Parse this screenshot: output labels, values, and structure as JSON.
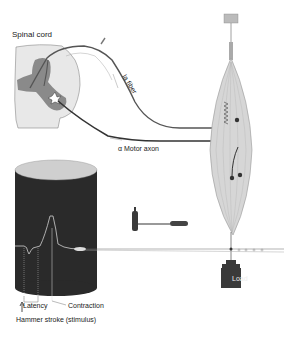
{
  "diagram": {
    "labels": {
      "spinal_cord": "Spinal cord",
      "ia_fiber": "Ia fiber",
      "motor_axon": "α Motor axon",
      "latency": "Latency",
      "contraction": "Contraction",
      "hammer_stroke": "Hammer stroke (stimulus)",
      "load": "Load"
    },
    "components": [
      {
        "id": "spinal-cord",
        "description": "cross-section of spinal cord with gray matter butterfly and motor neuron"
      },
      {
        "id": "ia-fiber",
        "description": "afferent fiber from muscle spindle to spinal cord"
      },
      {
        "id": "alpha-motor-axon",
        "description": "efferent axon from spinal cord to muscle"
      },
      {
        "id": "muscle",
        "description": "spindle-shaped muscle with muscle spindle and motor endplates"
      },
      {
        "id": "kymograph-drum",
        "description": "dark recording drum with response trace"
      },
      {
        "id": "reflex-hammer",
        "description": "hammer used to tap tendon"
      },
      {
        "id": "lever",
        "description": "recording lever linked to muscle tendon"
      },
      {
        "id": "load-weight",
        "description": "weight attached below muscle"
      },
      {
        "id": "anchor",
        "description": "fixed attachment at top of muscle"
      }
    ],
    "colors": {
      "background": "#ffffff",
      "line": "#444444",
      "gray_matter": "#8a8a8a",
      "white_matter": "#e6e6e6",
      "drum": "#2a2a2a",
      "muscle": "#d6d6d6",
      "load": "#3a3a3a"
    }
  }
}
